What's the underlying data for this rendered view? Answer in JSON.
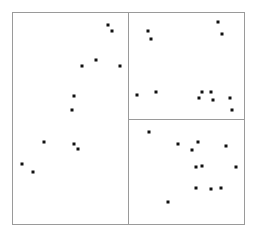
{
  "chart_data": {
    "type": "scatter",
    "title": "",
    "layout": "three-panel scatter matrix: one tall left panel, two stacked right panels",
    "grid": false,
    "legend": null,
    "axes_ticks": "none",
    "frame_color": "#9a9a9a",
    "point_color": "#111111",
    "panels": [
      {
        "id": "left",
        "bounds_px": [
          12,
          12,
          128,
          224
        ],
        "points_px": [
          [
            108,
            25
          ],
          [
            112,
            31
          ],
          [
            96,
            60
          ],
          [
            82,
            66
          ],
          [
            120,
            66
          ],
          [
            74,
            96
          ],
          [
            72,
            110
          ],
          [
            44,
            142
          ],
          [
            74,
            144
          ],
          [
            78,
            149
          ],
          [
            22,
            164
          ],
          [
            33,
            172
          ]
        ]
      },
      {
        "id": "top-right",
        "bounds_px": [
          128,
          12,
          244,
          119
        ],
        "points_px": [
          [
            218,
            22
          ],
          [
            222,
            34
          ],
          [
            148,
            31
          ],
          [
            151,
            39
          ],
          [
            137,
            95
          ],
          [
            156,
            92
          ],
          [
            202,
            92
          ],
          [
            211,
            92
          ],
          [
            199,
            98
          ],
          [
            213,
            100
          ],
          [
            230,
            98
          ],
          [
            232,
            110
          ]
        ]
      },
      {
        "id": "bottom-right",
        "bounds_px": [
          128,
          119,
          244,
          224
        ],
        "points_px": [
          [
            149,
            132
          ],
          [
            178,
            144
          ],
          [
            198,
            142
          ],
          [
            192,
            150
          ],
          [
            226,
            146
          ],
          [
            196,
            167
          ],
          [
            202,
            166
          ],
          [
            236,
            167
          ],
          [
            196,
            188
          ],
          [
            211,
            189
          ],
          [
            221,
            188
          ],
          [
            168,
            202
          ]
        ]
      }
    ]
  }
}
